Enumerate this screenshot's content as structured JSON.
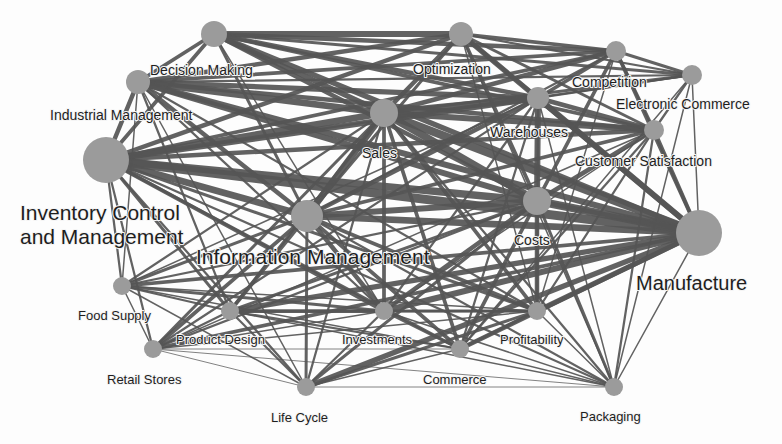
{
  "diagram": {
    "type": "keyword-co-occurrence-network",
    "colors": {
      "node": "#9b9b9b",
      "edge": "#555555",
      "label": "#1e1e1e",
      "background": "#fdfdfd"
    },
    "nodes": [
      {
        "id": "top",
        "label": "",
        "x": 214,
        "y": 34,
        "r": 13
      },
      {
        "id": "opt",
        "label": "Optimization",
        "x": 461,
        "y": 34,
        "r": 12,
        "lx": 413,
        "ly": 74,
        "size": "mid"
      },
      {
        "id": "comp",
        "label": "Competition",
        "x": 616,
        "y": 51,
        "r": 10,
        "lx": 572,
        "ly": 87,
        "size": "mid"
      },
      {
        "id": "ecom",
        "label": "Electronic Commerce",
        "x": 692,
        "y": 75,
        "r": 10,
        "lx": 616,
        "ly": 109,
        "size": "mid"
      },
      {
        "id": "dm",
        "label": "Decision Making",
        "x": 138,
        "y": 82,
        "r": 12,
        "lx": 150,
        "ly": 75,
        "size": "mid"
      },
      {
        "id": "sales",
        "label": "Sales",
        "x": 384,
        "y": 113,
        "r": 14,
        "lx": 362,
        "ly": 158,
        "size": "mid"
      },
      {
        "id": "wh",
        "label": "Warehouses",
        "x": 538,
        "y": 98,
        "r": 11,
        "lx": 490,
        "ly": 137,
        "size": "mid"
      },
      {
        "id": "cs",
        "label": "Customer Satisfaction",
        "x": 654,
        "y": 130,
        "r": 10,
        "lx": 575,
        "ly": 166,
        "size": "mid"
      },
      {
        "id": "inv",
        "label": "Inventory Control|and Management",
        "x": 106,
        "y": 160,
        "r": 23,
        "lx": 20,
        "ly": 220,
        "size": "big"
      },
      {
        "id": "im",
        "label": "Industrial Management",
        "x": 106,
        "y": 160,
        "r": 0,
        "lx": 50,
        "ly": 120,
        "size": "mid",
        "labelOnly": true
      },
      {
        "id": "info",
        "label": "Information Management",
        "x": 307,
        "y": 216,
        "r": 16,
        "lx": 196,
        "ly": 264,
        "size": "xl2"
      },
      {
        "id": "costs",
        "label": "Costs",
        "x": 537,
        "y": 201,
        "r": 14,
        "lx": 514,
        "ly": 245,
        "size": "mid"
      },
      {
        "id": "manu",
        "label": "Manufacture",
        "x": 699,
        "y": 233,
        "r": 23,
        "lx": 636,
        "ly": 290,
        "size": "xl"
      },
      {
        "id": "food",
        "label": "Food Supply",
        "x": 122,
        "y": 286,
        "r": 9,
        "lx": 78,
        "ly": 320,
        "size": "small"
      },
      {
        "id": "pd",
        "label": "Product Design",
        "x": 230,
        "y": 311,
        "r": 9,
        "lx": 176,
        "ly": 344,
        "size": "small"
      },
      {
        "id": "invest",
        "label": "Investments",
        "x": 384,
        "y": 311,
        "r": 9,
        "lx": 342,
        "ly": 344,
        "size": "small"
      },
      {
        "id": "prof",
        "label": "Profitability",
        "x": 537,
        "y": 311,
        "r": 9,
        "lx": 500,
        "ly": 344,
        "size": "small"
      },
      {
        "id": "retail",
        "label": "Retail Stores",
        "x": 153,
        "y": 349,
        "r": 9,
        "lx": 107,
        "ly": 384,
        "size": "small"
      },
      {
        "id": "comm",
        "label": "Commerce",
        "x": 460,
        "y": 349,
        "r": 9,
        "lx": 423,
        "ly": 384,
        "size": "small"
      },
      {
        "id": "life",
        "label": "Life Cycle",
        "x": 306,
        "y": 387,
        "r": 9,
        "lx": 271,
        "ly": 422,
        "size": "small"
      },
      {
        "id": "pack",
        "label": "Packaging",
        "x": 614,
        "y": 387,
        "r": 9,
        "lx": 580,
        "ly": 421,
        "size": "small"
      }
    ],
    "edges": [
      [
        "top",
        "opt",
        8
      ],
      [
        "top",
        "comp",
        6
      ],
      [
        "top",
        "ecom",
        4
      ],
      [
        "top",
        "dm",
        5
      ],
      [
        "top",
        "sales",
        7
      ],
      [
        "top",
        "wh",
        6
      ],
      [
        "top",
        "cs",
        5
      ],
      [
        "top",
        "inv",
        5
      ],
      [
        "top",
        "costs",
        6
      ],
      [
        "top",
        "manu",
        7
      ],
      [
        "top",
        "info",
        4
      ],
      [
        "top",
        "invest",
        2
      ],
      [
        "opt",
        "comp",
        5
      ],
      [
        "opt",
        "ecom",
        3
      ],
      [
        "opt",
        "dm",
        6
      ],
      [
        "opt",
        "sales",
        6
      ],
      [
        "opt",
        "wh",
        5
      ],
      [
        "opt",
        "cs",
        4
      ],
      [
        "opt",
        "inv",
        6
      ],
      [
        "opt",
        "costs",
        5
      ],
      [
        "opt",
        "manu",
        7
      ],
      [
        "opt",
        "info",
        4
      ],
      [
        "opt",
        "prof",
        2
      ],
      [
        "opt",
        "pack",
        2
      ],
      [
        "comp",
        "ecom",
        4
      ],
      [
        "comp",
        "dm",
        5
      ],
      [
        "comp",
        "sales",
        6
      ],
      [
        "comp",
        "wh",
        5
      ],
      [
        "comp",
        "cs",
        4
      ],
      [
        "comp",
        "inv",
        5
      ],
      [
        "comp",
        "costs",
        5
      ],
      [
        "comp",
        "manu",
        5
      ],
      [
        "comp",
        "info",
        3
      ],
      [
        "comp",
        "prof",
        2
      ],
      [
        "ecom",
        "cs",
        3
      ],
      [
        "ecom",
        "wh",
        3
      ],
      [
        "ecom",
        "sales",
        4
      ],
      [
        "ecom",
        "manu",
        2
      ],
      [
        "ecom",
        "dm",
        3
      ],
      [
        "ecom",
        "inv",
        3
      ],
      [
        "ecom",
        "comm",
        2
      ],
      [
        "dm",
        "sales",
        9
      ],
      [
        "dm",
        "wh",
        7
      ],
      [
        "dm",
        "cs",
        6
      ],
      [
        "dm",
        "inv",
        6
      ],
      [
        "dm",
        "costs",
        8
      ],
      [
        "dm",
        "manu",
        8
      ],
      [
        "dm",
        "info",
        6
      ],
      [
        "dm",
        "invest",
        3
      ],
      [
        "dm",
        "prof",
        3
      ],
      [
        "dm",
        "pd",
        3
      ],
      [
        "dm",
        "food",
        2
      ],
      [
        "dm",
        "life",
        2
      ],
      [
        "sales",
        "wh",
        10
      ],
      [
        "sales",
        "cs",
        8
      ],
      [
        "sales",
        "inv",
        9
      ],
      [
        "sales",
        "costs",
        10
      ],
      [
        "sales",
        "manu",
        11
      ],
      [
        "sales",
        "info",
        9
      ],
      [
        "sales",
        "invest",
        5
      ],
      [
        "sales",
        "prof",
        5
      ],
      [
        "sales",
        "comm",
        5
      ],
      [
        "sales",
        "pd",
        4
      ],
      [
        "sales",
        "retail",
        4
      ],
      [
        "sales",
        "food",
        3
      ],
      [
        "sales",
        "life",
        3
      ],
      [
        "sales",
        "pack",
        3
      ],
      [
        "wh",
        "cs",
        6
      ],
      [
        "wh",
        "inv",
        8
      ],
      [
        "wh",
        "costs",
        8
      ],
      [
        "wh",
        "manu",
        8
      ],
      [
        "wh",
        "info",
        6
      ],
      [
        "wh",
        "invest",
        3
      ],
      [
        "wh",
        "prof",
        3
      ],
      [
        "wh",
        "comm",
        3
      ],
      [
        "wh",
        "retail",
        3
      ],
      [
        "wh",
        "food",
        2
      ],
      [
        "wh",
        "pack",
        2
      ],
      [
        "cs",
        "inv",
        6
      ],
      [
        "cs",
        "costs",
        6
      ],
      [
        "cs",
        "manu",
        5
      ],
      [
        "cs",
        "info",
        5
      ],
      [
        "cs",
        "prof",
        3
      ],
      [
        "cs",
        "comm",
        3
      ],
      [
        "cs",
        "invest",
        2
      ],
      [
        "cs",
        "pack",
        3
      ],
      [
        "cs",
        "retail",
        2
      ],
      [
        "inv",
        "costs",
        10
      ],
      [
        "inv",
        "manu",
        12
      ],
      [
        "inv",
        "info",
        9
      ],
      [
        "inv",
        "invest",
        5
      ],
      [
        "inv",
        "prof",
        4
      ],
      [
        "inv",
        "comm",
        4
      ],
      [
        "inv",
        "pd",
        4
      ],
      [
        "inv",
        "food",
        3
      ],
      [
        "inv",
        "retail",
        3
      ],
      [
        "inv",
        "life",
        3
      ],
      [
        "inv",
        "pack",
        3
      ],
      [
        "info",
        "costs",
        8
      ],
      [
        "info",
        "manu",
        9
      ],
      [
        "info",
        "invest",
        6
      ],
      [
        "info",
        "prof",
        5
      ],
      [
        "info",
        "comm",
        5
      ],
      [
        "info",
        "pd",
        5
      ],
      [
        "info",
        "food",
        4
      ],
      [
        "info",
        "retail",
        5
      ],
      [
        "info",
        "life",
        4
      ],
      [
        "info",
        "pack",
        3
      ],
      [
        "costs",
        "manu",
        11
      ],
      [
        "costs",
        "invest",
        6
      ],
      [
        "costs",
        "prof",
        6
      ],
      [
        "costs",
        "comm",
        5
      ],
      [
        "costs",
        "pd",
        4
      ],
      [
        "costs",
        "food",
        3
      ],
      [
        "costs",
        "retail",
        3
      ],
      [
        "costs",
        "life",
        4
      ],
      [
        "costs",
        "pack",
        4
      ],
      [
        "manu",
        "invest",
        8
      ],
      [
        "manu",
        "prof",
        7
      ],
      [
        "manu",
        "comm",
        6
      ],
      [
        "manu",
        "pd",
        7
      ],
      [
        "manu",
        "food",
        5
      ],
      [
        "manu",
        "retail",
        5
      ],
      [
        "manu",
        "life",
        7
      ],
      [
        "manu",
        "pack",
        2
      ],
      [
        "food",
        "pd",
        3
      ],
      [
        "food",
        "invest",
        4
      ],
      [
        "food",
        "retail",
        2
      ],
      [
        "food",
        "prof",
        2
      ],
      [
        "food",
        "life",
        2
      ],
      [
        "food",
        "comm",
        2
      ],
      [
        "pd",
        "invest",
        5
      ],
      [
        "pd",
        "prof",
        3
      ],
      [
        "pd",
        "retail",
        3
      ],
      [
        "pd",
        "life",
        3
      ],
      [
        "pd",
        "comm",
        3
      ],
      [
        "pd",
        "pack",
        2
      ],
      [
        "invest",
        "prof",
        4
      ],
      [
        "invest",
        "comm",
        4
      ],
      [
        "invest",
        "life",
        3
      ],
      [
        "invest",
        "retail",
        2
      ],
      [
        "invest",
        "pack",
        2
      ],
      [
        "prof",
        "comm",
        4
      ],
      [
        "prof",
        "life",
        4
      ],
      [
        "prof",
        "pack",
        2
      ],
      [
        "prof",
        "retail",
        2
      ],
      [
        "retail",
        "life",
        1
      ],
      [
        "retail",
        "comm",
        1
      ],
      [
        "retail",
        "pack",
        1
      ],
      [
        "life",
        "comm",
        2
      ],
      [
        "life",
        "pack",
        1
      ],
      [
        "comm",
        "pack",
        2
      ],
      [
        "ecom",
        "pack",
        2
      ],
      [
        "manu",
        "costs",
        6
      ]
    ]
  }
}
